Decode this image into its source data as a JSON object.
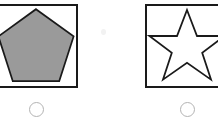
{
  "page": {
    "background_color": "#ffffff"
  },
  "style": {
    "frame_stroke": "#1a1a1a",
    "frame_fill": "#ffffff",
    "radio_stroke": "#b3b3b3",
    "radio_fill": "#ffffff",
    "shape_outline": "#1a1a1a"
  },
  "options": [
    {
      "id": "option-a",
      "shape_name": "pentagon",
      "shape_fill": "#9a9a9a",
      "shape_stroke": "#1a1a1a",
      "selected": false,
      "radio_state": "unselected"
    },
    {
      "id": "option-b",
      "shape_name": "star",
      "shape_fill": "#ffffff",
      "shape_stroke": "#1a1a1a",
      "selected": false,
      "radio_state": "unselected"
    }
  ]
}
